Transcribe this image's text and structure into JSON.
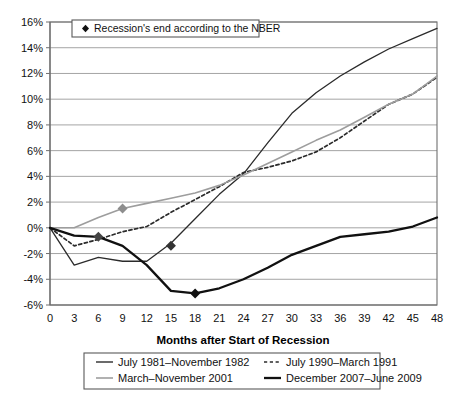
{
  "chart_data": {
    "type": "line",
    "title": "",
    "xlabel": "Months after Start of Recession",
    "ylabel": "",
    "xlim": [
      0,
      48
    ],
    "ylim": [
      -6,
      16
    ],
    "grid": true,
    "legend_position": "bottom",
    "x_tick_labels": [
      "0",
      "3",
      "6",
      "9",
      "12",
      "15",
      "18",
      "21",
      "24",
      "27",
      "30",
      "33",
      "36",
      "39",
      "42",
      "45",
      "48"
    ],
    "x_ticks": [
      0,
      3,
      6,
      9,
      12,
      15,
      18,
      21,
      24,
      27,
      30,
      33,
      36,
      39,
      42,
      45,
      48
    ],
    "y_tick_labels": [
      "16%",
      "14%",
      "12%",
      "10%",
      "8%",
      "6%",
      "4%",
      "2%",
      "0%",
      "-2%",
      "-4%",
      "-6%"
    ],
    "y_ticks": [
      16,
      14,
      12,
      10,
      8,
      6,
      4,
      2,
      0,
      -2,
      -4,
      -6
    ],
    "x": [
      0,
      3,
      6,
      9,
      12,
      15,
      18,
      21,
      24,
      27,
      30,
      33,
      36,
      39,
      42,
      45,
      48
    ],
    "series": [
      {
        "name": "July 1981–November 1982",
        "style": "solid-thin",
        "color": "#2b2b2b",
        "width": 1.3,
        "values": [
          0,
          -2.9,
          -2.3,
          -2.6,
          -2.6,
          -1.2,
          0.7,
          2.6,
          4.2,
          6.6,
          8.9,
          10.5,
          11.8,
          12.9,
          13.9,
          14.7,
          15.5
        ]
      },
      {
        "name": "July 1990–March 1991",
        "style": "dashed",
        "color": "#2b2b2b",
        "width": 1.7,
        "values": [
          0,
          -1.4,
          -0.9,
          -0.3,
          0.1,
          1.2,
          2.2,
          3.2,
          4.3,
          4.7,
          5.2,
          5.9,
          7.0,
          8.3,
          9.6,
          10.4,
          11.7
        ]
      },
      {
        "name": "March–November 2001",
        "style": "solid-gray",
        "color": "#9d9d9d",
        "width": 1.6,
        "values": [
          0,
          0.0,
          0.8,
          1.5,
          1.9,
          2.3,
          2.7,
          3.3,
          4.1,
          5.0,
          5.9,
          6.8,
          7.6,
          8.6,
          9.6,
          10.4,
          11.8
        ]
      },
      {
        "name": "December 2007–June 2009",
        "style": "solid-thick",
        "color": "#111111",
        "width": 2.3,
        "values": [
          0,
          -0.6,
          -0.7,
          -1.4,
          -2.9,
          -4.9,
          -5.1,
          -4.7,
          -4.0,
          -3.1,
          -2.1,
          -1.4,
          -0.7,
          -0.5,
          -0.3,
          0.1,
          0.8
        ]
      }
    ],
    "markers": {
      "label": "Recession's end according to the NBER",
      "shape": "diamond",
      "points": [
        {
          "series": "December 2007–June 2009",
          "x": 18,
          "y": -5.1,
          "color": "#111111"
        },
        {
          "series": "July 1981–November 1982",
          "x": 15,
          "y": -1.4,
          "color": "#333333"
        },
        {
          "series": "July 1990–March 1991",
          "x": 6,
          "y": -0.7,
          "color": "#444444"
        },
        {
          "series": "March–November 2001",
          "x": 9,
          "y": 1.5,
          "color": "#8d8d8d"
        }
      ]
    }
  },
  "marker_legend": {
    "text": "Recession's end according to the NBER"
  },
  "legend": {
    "entries": [
      {
        "label": "July 1981–November 1982",
        "style": "solid-thin",
        "color": "#2b2b2b"
      },
      {
        "label": "July 1990–March 1991",
        "style": "dashed",
        "color": "#2b2b2b"
      },
      {
        "label": "March–November 2001",
        "style": "solid-gray",
        "color": "#9d9d9d"
      },
      {
        "label": "December 2007–June 2009",
        "style": "solid-thick",
        "color": "#111111"
      }
    ]
  },
  "axis": {
    "x_title": "Months after Start of Recession"
  }
}
